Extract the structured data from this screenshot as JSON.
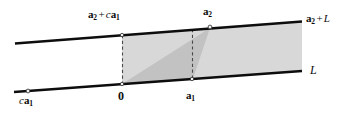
{
  "figure": {
    "background": "#ffffff",
    "width": 340,
    "height": 114,
    "colors": {
      "line": "#0d0d0d",
      "dashed": "#4a4a4a",
      "shade_light": "#d8d8d8",
      "shade_mid": "#cfcfcf",
      "shade_dark": "#c2c2c2",
      "text": "#0d0d0d"
    },
    "lines": [
      {
        "name": "upper-line",
        "label": "a2 + L",
        "x1": 15,
        "y1": 43,
        "x2": 302,
        "y2": 21
      },
      {
        "name": "lower-line",
        "label": "L",
        "x1": 14,
        "y1": 92,
        "x2": 302,
        "y2": 71
      }
    ],
    "points": [
      {
        "name": "c-a1",
        "x": 28,
        "y": 91
      },
      {
        "name": "origin",
        "x": 122,
        "y": 84
      },
      {
        "name": "a1",
        "x": 192,
        "y": 79
      },
      {
        "name": "a2-plus-c-a1",
        "x": 122,
        "y": 35
      },
      {
        "name": "a2",
        "x": 210,
        "y": 27
      }
    ]
  },
  "labels": {
    "upper_left": {
      "id": "a2-plus-c-a1",
      "parts": [
        {
          "text": "a",
          "style": "bold"
        },
        {
          "text": "2",
          "style": "sub"
        },
        {
          "text": "+",
          "style": "op"
        },
        {
          "text": "c",
          "style": "italic"
        },
        {
          "text": "a",
          "style": "bold"
        },
        {
          "text": "1",
          "style": "sub"
        }
      ],
      "plain": "a2 + c a1",
      "x": 88,
      "y": 9
    },
    "upper_mid": {
      "id": "a2",
      "parts": [
        {
          "text": "a",
          "style": "bold"
        },
        {
          "text": "2",
          "style": "sub"
        }
      ],
      "plain": "a2",
      "x": 203,
      "y": 6
    },
    "upper_right": {
      "id": "a2-plus-L",
      "parts": [
        {
          "text": "a",
          "style": "bold"
        },
        {
          "text": "2",
          "style": "sub"
        },
        {
          "text": "+",
          "style": "op"
        },
        {
          "text": "L",
          "style": "italic"
        }
      ],
      "plain": "a2 + L",
      "x": 306,
      "y": 13
    },
    "lower_right": {
      "id": "L",
      "parts": [
        {
          "text": "L",
          "style": "italic"
        }
      ],
      "plain": "L",
      "x": 310,
      "y": 64
    },
    "lower_left": {
      "id": "c-a1",
      "parts": [
        {
          "text": "c",
          "style": "italic"
        },
        {
          "text": "a",
          "style": "bold"
        },
        {
          "text": "1",
          "style": "sub"
        }
      ],
      "plain": "c a1",
      "x": 19,
      "y": 95
    },
    "origin": {
      "id": "zero",
      "parts": [
        {
          "text": "0",
          "style": "bold"
        }
      ],
      "plain": "0",
      "x": 118,
      "y": 90
    },
    "a1": {
      "id": "a1",
      "parts": [
        {
          "text": "a",
          "style": "bold"
        },
        {
          "text": "1",
          "style": "sub"
        }
      ],
      "plain": "a1",
      "x": 186,
      "y": 90
    }
  },
  "regions": [
    {
      "name": "center-parallelogram-upper-half",
      "shade": "#d8d8d8",
      "description": "lighter upper-left triangle of central parallelogram"
    },
    {
      "name": "center-parallelogram-lower-half",
      "shade": "#c2c2c2",
      "description": "darker lower-right triangle of central parallelogram"
    },
    {
      "name": "right-wedge",
      "shade": "#d8d8d8",
      "description": "light triangular wedge fanning right from a2"
    }
  ]
}
